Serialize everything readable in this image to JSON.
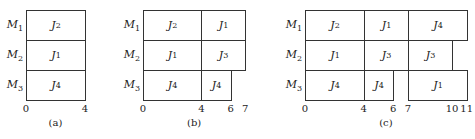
{
  "figure": {
    "panels": [
      {
        "id": "a",
        "caption": "(a)",
        "origin_x": 26,
        "unit_px": 14.75,
        "machines": [
          {
            "label": "M",
            "sub": "1",
            "jobs": [
              {
                "label": "J",
                "sub": "2",
                "start": 0,
                "end": 4
              }
            ]
          },
          {
            "label": "M",
            "sub": "2",
            "jobs": [
              {
                "label": "J",
                "sub": "1",
                "start": 0,
                "end": 4
              }
            ]
          },
          {
            "label": "M",
            "sub": "3",
            "jobs": [
              {
                "label": "J",
                "sub": "4",
                "start": 0,
                "end": 4
              }
            ]
          }
        ],
        "ticks": [
          "0",
          "4"
        ],
        "tick_values": [
          0,
          4
        ]
      },
      {
        "id": "b",
        "caption": "(b)",
        "origin_x": 143,
        "unit_px": 14.6,
        "machines": [
          {
            "label": "M",
            "sub": "1",
            "jobs": [
              {
                "label": "J",
                "sub": "2",
                "start": 0,
                "end": 4
              },
              {
                "label": "J",
                "sub": "1",
                "start": 4,
                "end": 7
              }
            ]
          },
          {
            "label": "M",
            "sub": "2",
            "jobs": [
              {
                "label": "J",
                "sub": "1",
                "start": 0,
                "end": 4
              },
              {
                "label": "J",
                "sub": "3",
                "start": 4,
                "end": 7
              }
            ]
          },
          {
            "label": "M",
            "sub": "3",
            "jobs": [
              {
                "label": "J",
                "sub": "4",
                "start": 0,
                "end": 4
              },
              {
                "label": "J",
                "sub": "4",
                "start": 4,
                "end": 6
              }
            ]
          }
        ],
        "ticks": [
          "0",
          "4",
          "6",
          "7"
        ],
        "tick_values": [
          0,
          4,
          6,
          7
        ]
      },
      {
        "id": "c",
        "caption": "(c)",
        "origin_x": 305,
        "unit_px": 14.7,
        "machines": [
          {
            "label": "M",
            "sub": "1",
            "jobs": [
              {
                "label": "J",
                "sub": "2",
                "start": 0,
                "end": 4
              },
              {
                "label": "J",
                "sub": "1",
                "start": 4,
                "end": 7
              },
              {
                "label": "J",
                "sub": "4",
                "start": 7,
                "end": 11
              }
            ]
          },
          {
            "label": "M",
            "sub": "2",
            "jobs": [
              {
                "label": "J",
                "sub": "1",
                "start": 0,
                "end": 4
              },
              {
                "label": "J",
                "sub": "3",
                "start": 4,
                "end": 7
              },
              {
                "label": "J",
                "sub": "3",
                "start": 7,
                "end": 10
              }
            ]
          },
          {
            "label": "M",
            "sub": "3",
            "jobs": [
              {
                "label": "J",
                "sub": "4",
                "start": 0,
                "end": 4
              },
              {
                "label": "J",
                "sub": "4",
                "start": 4,
                "end": 6
              },
              {
                "label": "J",
                "sub": "1",
                "start": 7,
                "end": 11
              }
            ]
          }
        ],
        "ticks": [
          "0",
          "4",
          "6",
          "7",
          "10",
          "11"
        ],
        "tick_values": [
          0,
          4,
          6,
          7,
          10,
          11
        ]
      }
    ],
    "row_top": 10,
    "row_height": 30
  }
}
